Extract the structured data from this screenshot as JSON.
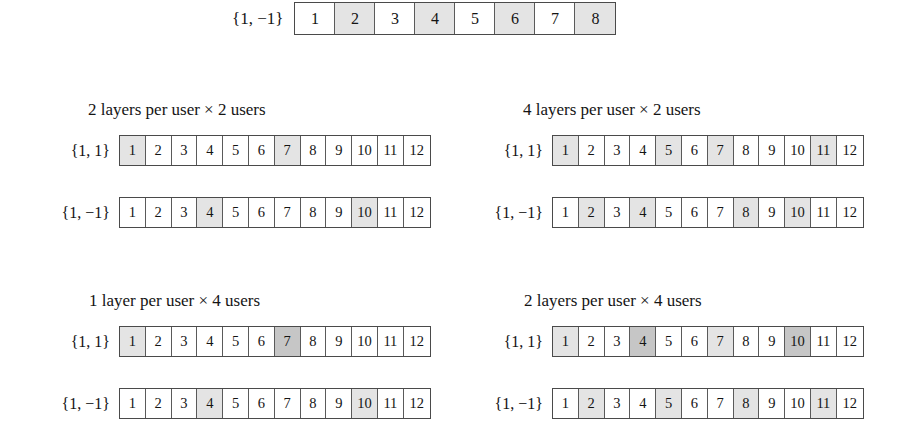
{
  "figure": {
    "type": "diagram"
  },
  "top_strip": {
    "label": "{1, −1}",
    "cells": [
      1,
      2,
      3,
      4,
      5,
      6,
      7,
      8
    ],
    "shaded_lite": [
      2,
      4,
      6,
      8
    ],
    "shaded_dark": []
  },
  "panels": [
    {
      "id": "panel-tl",
      "title": "2 layers per user × 2 users",
      "rows": [
        {
          "label": "{1, 1}",
          "cells": [
            1,
            2,
            3,
            4,
            5,
            6,
            7,
            8,
            9,
            10,
            11,
            12
          ],
          "shaded_lite": [
            1,
            7
          ],
          "shaded_dark": []
        },
        {
          "label": "{1, −1}",
          "cells": [
            1,
            2,
            3,
            4,
            5,
            6,
            7,
            8,
            9,
            10,
            11,
            12
          ],
          "shaded_lite": [
            4,
            10
          ],
          "shaded_dark": []
        }
      ]
    },
    {
      "id": "panel-tr",
      "title": "4 layers per user × 2 users",
      "rows": [
        {
          "label": "{1, 1}",
          "cells": [
            1,
            2,
            3,
            4,
            5,
            6,
            7,
            8,
            9,
            10,
            11,
            12
          ],
          "shaded_lite": [
            1,
            5,
            7,
            11
          ],
          "shaded_dark": []
        },
        {
          "label": "{1, −1}",
          "cells": [
            1,
            2,
            3,
            4,
            5,
            6,
            7,
            8,
            9,
            10,
            11,
            12
          ],
          "shaded_lite": [
            2,
            4,
            8,
            10
          ],
          "shaded_dark": []
        }
      ]
    },
    {
      "id": "panel-bl",
      "title": "1 layer per user × 4 users",
      "rows": [
        {
          "label": "{1, 1}",
          "cells": [
            1,
            2,
            3,
            4,
            5,
            6,
            7,
            8,
            9,
            10,
            11,
            12
          ],
          "shaded_lite": [
            1
          ],
          "shaded_dark": [
            7
          ]
        },
        {
          "label": "{1, −1}",
          "cells": [
            1,
            2,
            3,
            4,
            5,
            6,
            7,
            8,
            9,
            10,
            11,
            12
          ],
          "shaded_lite": [
            4,
            10
          ],
          "shaded_dark": []
        }
      ]
    },
    {
      "id": "panel-br",
      "title": "2 layers per user × 4 users",
      "rows": [
        {
          "label": "{1, 1}",
          "cells": [
            1,
            2,
            3,
            4,
            5,
            6,
            7,
            8,
            9,
            10,
            11,
            12
          ],
          "shaded_lite": [
            1,
            7
          ],
          "shaded_dark": [
            4,
            10
          ]
        },
        {
          "label": "{1, −1}",
          "cells": [
            1,
            2,
            3,
            4,
            5,
            6,
            7,
            8,
            9,
            10,
            11,
            12
          ],
          "shaded_lite": [
            2,
            5,
            8,
            11
          ],
          "shaded_dark": []
        }
      ]
    }
  ],
  "colors": {
    "cell_border": "#5a5a5a",
    "strip_border": "#4a4a4a",
    "shade_lite": "#e4e4e4",
    "shade_dark": "#c6c6c6",
    "background": "#ffffff",
    "text": "#141414"
  }
}
